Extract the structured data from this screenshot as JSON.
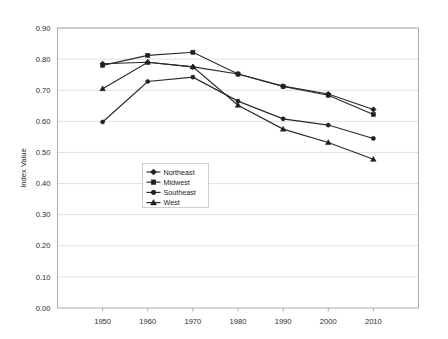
{
  "chart_data": {
    "type": "line",
    "title": "",
    "subtitle": "",
    "xlabel": "",
    "ylabel": "Index Value",
    "categories": [
      "1950",
      "1960",
      "1970",
      "1980",
      "1990",
      "2000",
      "2010"
    ],
    "x": [
      1950,
      1960,
      1970,
      1980,
      1990,
      2000,
      2010
    ],
    "xlim": [
      1945,
      2015
    ],
    "ylim": [
      0.0,
      0.9
    ],
    "ytick_labels": [
      "0.00",
      "0.10",
      "0.20",
      "0.30",
      "0.40",
      "0.50",
      "0.60",
      "0.70",
      "0.80",
      "0.90"
    ],
    "ytick_values": [
      0.0,
      0.1,
      0.2,
      0.3,
      0.4,
      0.5,
      0.6,
      0.7,
      0.8,
      0.9
    ],
    "grid": "horizontal",
    "legend_position": "center-left-inside",
    "series": [
      {
        "name": "Northeast",
        "marker": "diamond",
        "color": "#2a2a2a",
        "values": [
          0.785,
          0.79,
          0.775,
          0.752,
          0.713,
          0.688,
          0.638
        ]
      },
      {
        "name": "Midwest",
        "marker": "square",
        "color": "#2a2a2a",
        "values": [
          0.78,
          0.812,
          0.822,
          0.752,
          0.712,
          0.684,
          0.622
        ]
      },
      {
        "name": "Southeast",
        "marker": "circle",
        "color": "#2a2a2a",
        "values": [
          0.598,
          0.728,
          0.742,
          0.665,
          0.608,
          0.588,
          0.545
        ]
      },
      {
        "name": "West",
        "marker": "triangle",
        "color": "#2a2a2a",
        "values": [
          0.705,
          0.79,
          0.775,
          0.652,
          0.575,
          0.532,
          0.478
        ]
      }
    ]
  },
  "legend": {
    "entries": [
      "Northeast",
      "Midwest",
      "Southeast",
      "West"
    ]
  },
  "axes": {
    "y_title": "Index Value"
  }
}
